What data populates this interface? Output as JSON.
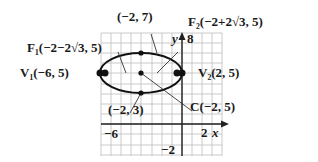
{
  "diagram": {
    "type": "ellipse-graph",
    "grid": {
      "x_min": -7,
      "x_max": 3,
      "y_min": -3,
      "y_max": 9,
      "unit": 1
    },
    "axes": {
      "x_label": "x",
      "y_label": "y",
      "x_ticks": [
        "-6",
        "2"
      ],
      "y_ticks": [
        "8",
        "-2"
      ]
    },
    "ellipse": {
      "center": [
        -2,
        5
      ],
      "a": 4,
      "b": 2,
      "orientation": "horizontal"
    },
    "points": [
      {
        "id": "F1",
        "label": "F₁(−2−2√3, 5)",
        "x": -5.464,
        "y": 5
      },
      {
        "id": "V1",
        "label": "V₁(−6, 5)",
        "x": -6,
        "y": 5
      },
      {
        "id": "top",
        "label": "(−2, 7)",
        "x": -2,
        "y": 7
      },
      {
        "id": "F2",
        "label": "F₂(−2+2√3, 5)",
        "x": 1.464,
        "y": 5
      },
      {
        "id": "V2",
        "label": "V₂(2, 5)",
        "x": 2,
        "y": 5
      },
      {
        "id": "bottom",
        "label": "(−2, 3)",
        "x": -2,
        "y": 3
      },
      {
        "id": "C",
        "label": "C(−2, 5)",
        "x": -2,
        "y": 5
      }
    ]
  },
  "labels": {
    "top": "(−2, 7)",
    "f1": "F₁(−2−2√3, 5)",
    "f2": "F₂(−2+2√3, 5)",
    "v1": "V₁(−6, 5)",
    "v2": "V₂(2, 5)",
    "bottom": "(−2, 3)",
    "center": "C(−2, 5)",
    "x_axis": "x",
    "y_axis": "y",
    "tick_x_neg6": "−6",
    "tick_x_2": "2",
    "tick_y_8": "8",
    "tick_y_neg2": "−2"
  },
  "colors": {
    "grid": "#b8b8b8",
    "axis": "#222222",
    "curve": "#111111",
    "text": "#1a1a1a"
  }
}
